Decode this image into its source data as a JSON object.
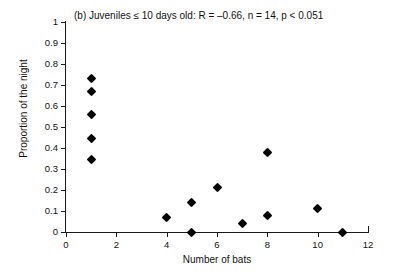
{
  "chart_data": {
    "type": "scatter",
    "title": "(b) Juveniles ≤ 10 days old: R = –0.66, n = 14, p < 0.051",
    "panel_label": "(b)",
    "xlabel": "Number of bats",
    "ylabel": "Proportion of the night",
    "xlim": [
      0,
      12
    ],
    "ylim": [
      0,
      1
    ],
    "grid": false,
    "legend": null,
    "xticks": [
      0,
      2,
      4,
      6,
      8,
      10,
      12
    ],
    "xtick_labels": [
      "0",
      "2",
      "4",
      "6",
      "8",
      "10",
      "12"
    ],
    "yticks": [
      0,
      0.1,
      0.2,
      0.3,
      0.4,
      0.5,
      0.6,
      0.7,
      0.8,
      0.9,
      1
    ],
    "ytick_labels": [
      "0",
      "0.1",
      "0.2",
      "0.3",
      "0.4",
      "0.5",
      "0.6",
      "0.7",
      "0.8",
      "0.9",
      "1"
    ],
    "marker": "diamond",
    "marker_color": "#000000",
    "statistics": {
      "R": -0.66,
      "n": 14,
      "p_text": "p < 0.051"
    },
    "x": [
      1,
      1,
      1,
      1,
      1,
      4,
      5,
      5,
      6,
      7,
      8,
      8,
      10,
      11
    ],
    "y": [
      0.73,
      0.67,
      0.56,
      0.445,
      0.345,
      0.07,
      0.14,
      0.0,
      0.21,
      0.04,
      0.38,
      0.08,
      0.11,
      0.0
    ],
    "points": [
      {
        "x": 1,
        "y": 0.73
      },
      {
        "x": 1,
        "y": 0.67
      },
      {
        "x": 1,
        "y": 0.56
      },
      {
        "x": 1,
        "y": 0.445
      },
      {
        "x": 1,
        "y": 0.345
      },
      {
        "x": 4,
        "y": 0.07
      },
      {
        "x": 5,
        "y": 0.14
      },
      {
        "x": 5,
        "y": 0.0
      },
      {
        "x": 6,
        "y": 0.21
      },
      {
        "x": 7,
        "y": 0.04
      },
      {
        "x": 8,
        "y": 0.38
      },
      {
        "x": 8,
        "y": 0.08
      },
      {
        "x": 10,
        "y": 0.11
      },
      {
        "x": 11,
        "y": 0.0
      }
    ]
  }
}
